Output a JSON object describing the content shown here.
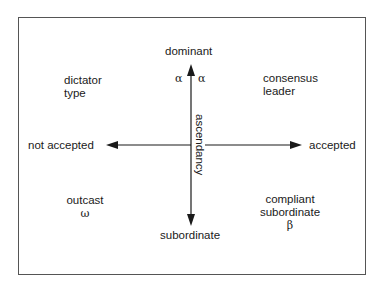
{
  "axes": {
    "vertical": {
      "top_label": "dominant",
      "bottom_label": "subordinate",
      "axis_title": "ascendancy"
    },
    "horizontal": {
      "left_label": "not accepted",
      "right_label": "accepted"
    }
  },
  "quadrants": {
    "top_left": {
      "line1": "dictator",
      "line2": "type"
    },
    "top_right": {
      "line1": "consensus",
      "line2": "leader"
    },
    "bottom_left": {
      "line1": "outcast",
      "symbol": "ω"
    },
    "bottom_right": {
      "line1": "compliant",
      "line2": "subordinate",
      "symbol": "β"
    }
  },
  "axis_symbols": {
    "alpha_left": "α",
    "alpha_right": "α"
  },
  "colors": {
    "line": "#1a1a1a",
    "frame": "#555555"
  }
}
